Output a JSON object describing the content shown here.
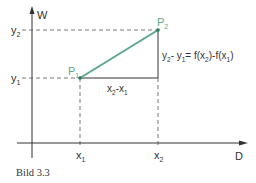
{
  "figure": {
    "caption": "Bild 3.3",
    "axes": {
      "x_label": "D",
      "y_label": "W"
    },
    "ticks": {
      "x1": "x",
      "x1_sub": "1",
      "x2": "x",
      "x2_sub": "2",
      "y1": "y",
      "y1_sub": "1",
      "y2": "y",
      "y2_sub": "2"
    },
    "points": {
      "p1": "P",
      "p1_sub": "1",
      "p2": "P",
      "p2_sub": "2"
    },
    "annotations": {
      "dx_a": "x",
      "dx_a_sub": "2",
      "dx_mid": "-x",
      "dx_b_sub": "1",
      "dy_text_a": "y",
      "dy_text_a_sub": "2",
      "dy_text_b": "- y",
      "dy_text_b_sub": "1",
      "dy_text_c": "= f(x",
      "dy_text_c_sub": "2",
      "dy_text_d": ")-f(x",
      "dy_text_d_sub": "1",
      "dy_text_e": ")"
    },
    "colors": {
      "secant": "#5aa88a",
      "axis": "#333333",
      "dashed": "#555555"
    }
  }
}
